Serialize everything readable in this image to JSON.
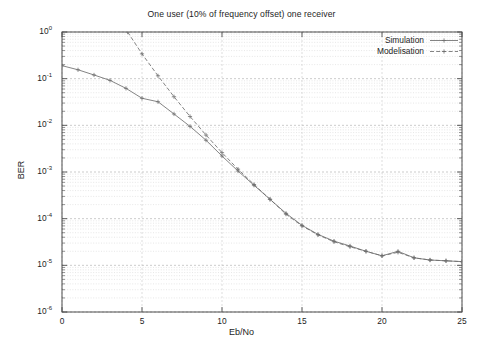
{
  "figure": {
    "title": "One user (10% of frequency offset) one receiver",
    "background": "#ffffff",
    "frame_color": "#4d4d4d"
  },
  "axes": {
    "xlabel": "Eb/No",
    "ylabel": "BER",
    "xticks": [
      "0",
      "5",
      "10",
      "15",
      "20",
      "25"
    ],
    "yticks": [
      "10",
      "10",
      "10",
      "10",
      "10",
      "10",
      "10"
    ],
    "yexponents": [
      "0",
      "-1",
      "-2",
      "-3",
      "-4",
      "-5",
      "-6"
    ]
  },
  "legend": {
    "entries": [
      {
        "label": "Simulation",
        "style": "solid",
        "color": "#6e6e6e",
        "marker": "plus"
      },
      {
        "label": "Modelisation",
        "style": "dashed",
        "color": "#6e6e6e",
        "marker": "plus"
      }
    ]
  },
  "chart_data": {
    "type": "line",
    "title": "One user (10% of frequency offset) one receiver",
    "xlabel": "Eb/No",
    "ylabel": "BER",
    "xlim": [
      0,
      25
    ],
    "ylim": [
      1e-06,
      1
    ],
    "yscale": "log",
    "xscale": "linear",
    "grid": true,
    "grid_minor": true,
    "legend_position": "upper right",
    "series": [
      {
        "name": "Simulation",
        "style": "solid",
        "marker": "plus",
        "color": "#6e6e6e",
        "x": [
          0,
          1,
          2,
          3,
          4,
          5,
          6,
          7,
          8,
          9,
          10,
          11,
          12,
          13,
          14,
          15,
          16,
          17,
          18,
          19,
          20,
          21,
          22,
          23,
          24,
          25
        ],
        "y": [
          0.19,
          0.155,
          0.12,
          0.092,
          0.062,
          0.038,
          0.032,
          0.0175,
          0.0095,
          0.0048,
          0.0022,
          0.00105,
          0.00052,
          0.00026,
          0.00013,
          7.2e-05,
          4.6e-05,
          3.3e-05,
          2.6e-05,
          2e-05,
          1.6e-05,
          2e-05,
          1.45e-05,
          1.3e-05,
          1.25e-05,
          1.2e-05
        ]
      },
      {
        "name": "Modelisation",
        "style": "dashed",
        "marker": "plus",
        "color": "#6e6e6e",
        "x": [
          4.1,
          5,
          6,
          7,
          8,
          9,
          10,
          11,
          12,
          13,
          14,
          15,
          16,
          17,
          18,
          19,
          20,
          21,
          22,
          23,
          24,
          25
        ],
        "y": [
          1.0,
          0.34,
          0.115,
          0.041,
          0.0155,
          0.0062,
          0.0026,
          0.00115,
          0.00054,
          0.00026,
          0.000125,
          7e-05,
          4.5e-05,
          3.2e-05,
          2.5e-05,
          2e-05,
          1.6e-05,
          1.9e-05,
          1.45e-05,
          1.3e-05,
          1.25e-05,
          1.2e-05
        ]
      }
    ]
  }
}
